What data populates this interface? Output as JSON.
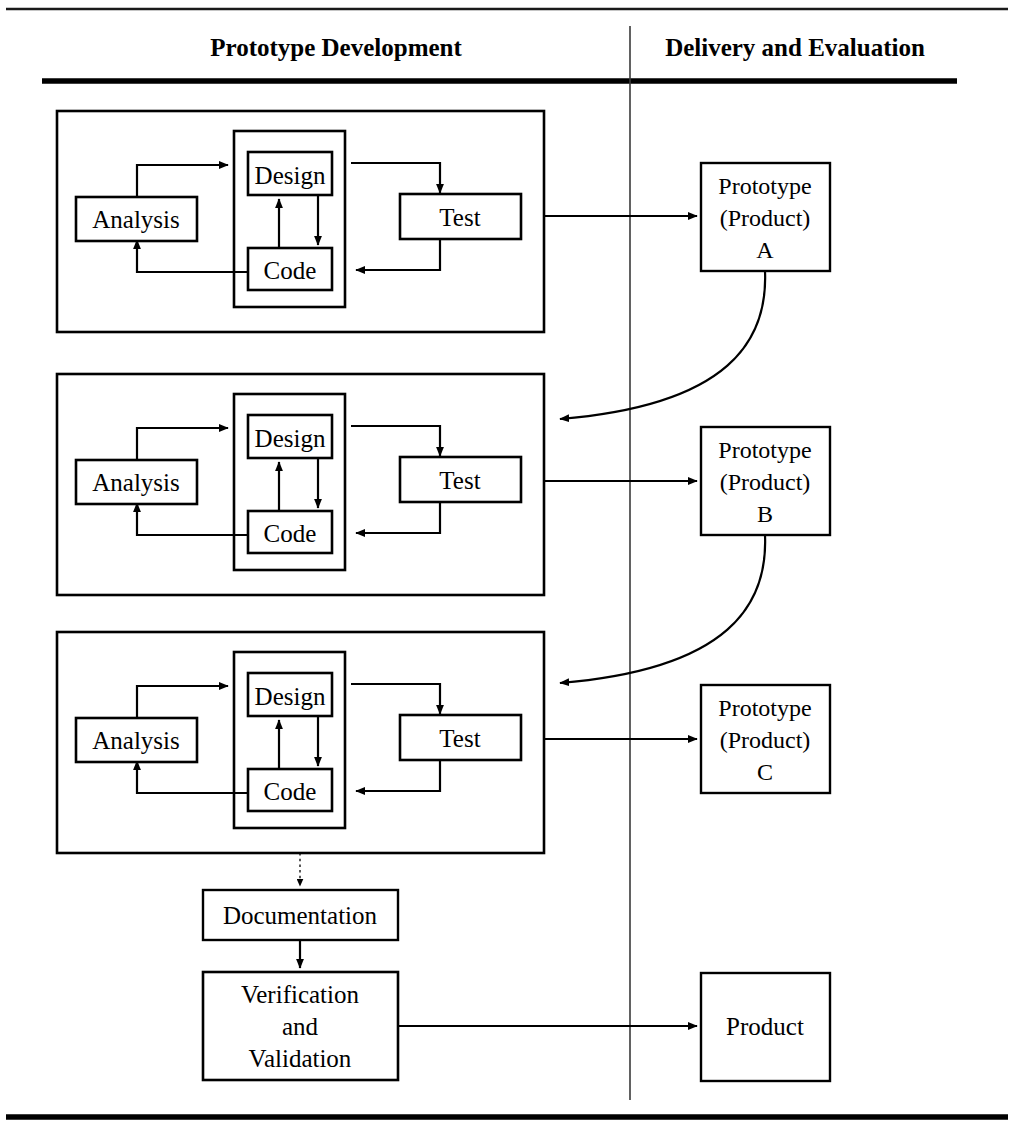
{
  "figure": {
    "type": "process-flow-diagram",
    "title_columns": {
      "left": "Prototype Development",
      "right": "Delivery and Evaluation"
    }
  },
  "headers": [
    {
      "key": "left",
      "label": "Prototype Development"
    },
    {
      "key": "right",
      "label": "Delivery and Evaluation"
    }
  ],
  "iterations": [
    {
      "id": "iteration-1",
      "nodes": {
        "analysis": "Analysis",
        "design": "Design",
        "code": "Code",
        "test": "Test"
      }
    },
    {
      "id": "iteration-2",
      "nodes": {
        "analysis": "Analysis",
        "design": "Design",
        "code": "Code",
        "test": "Test"
      }
    },
    {
      "id": "iteration-3",
      "nodes": {
        "analysis": "Analysis",
        "design": "Design",
        "code": "Code",
        "test": "Test"
      }
    }
  ],
  "deliverables": [
    {
      "id": "prototype-a",
      "line1": "Prototype",
      "line2": "(Product)",
      "line3": "A"
    },
    {
      "id": "prototype-b",
      "line1": "Prototype",
      "line2": "(Product)",
      "line3": "B"
    },
    {
      "id": "prototype-c",
      "line1": "Prototype",
      "line2": "(Product)",
      "line3": "C"
    }
  ],
  "final": {
    "documentation": "Documentation",
    "verification": {
      "line1": "Verification",
      "line2": "and",
      "line3": "Validation"
    },
    "product": "Product"
  },
  "colors": {
    "ink": "#000000",
    "paper": "#ffffff",
    "divider": "#3a3a3a"
  }
}
